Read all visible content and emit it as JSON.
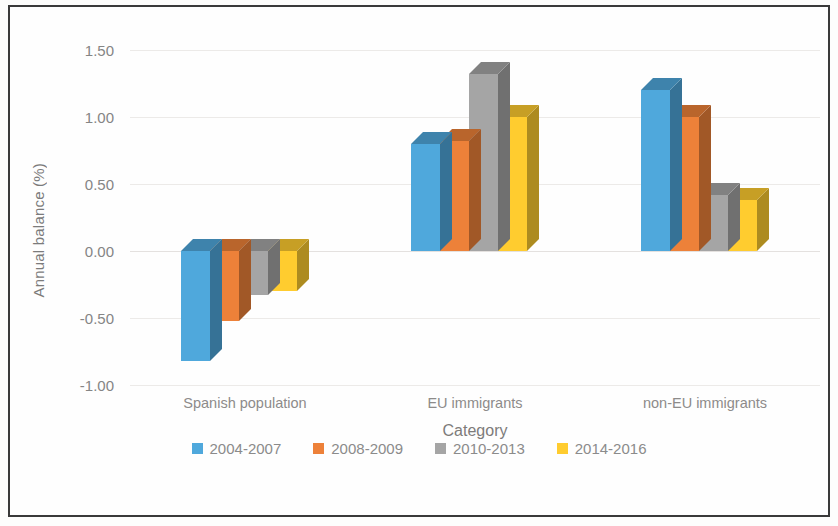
{
  "chart_data": {
    "type": "bar",
    "title": "",
    "subtitle": "",
    "xlabel": "Category",
    "ylabel": "Annual balance (%)",
    "categories": [
      "Spanish population",
      "EU immigrants",
      "non-EU immigrants"
    ],
    "series": [
      {
        "name": "2004-2007",
        "color": "#4FA8DC",
        "values": [
          -0.82,
          0.8,
          1.2
        ]
      },
      {
        "name": "2008-2009",
        "color": "#ED8139",
        "values": [
          -0.52,
          0.82,
          1.0
        ]
      },
      {
        "name": "2010-2013",
        "color": "#A5A5A5",
        "values": [
          -0.33,
          1.32,
          0.42
        ]
      },
      {
        "name": "2014-2016",
        "color": "#FFCC2F",
        "values": [
          -0.3,
          1.0,
          0.38
        ]
      }
    ],
    "ylim": [
      -1.0,
      1.5
    ],
    "yticks": [
      1.5,
      1.0,
      0.5,
      0.0,
      -0.5,
      -1.0
    ],
    "ytick_labels": [
      "1.50",
      "1.00",
      "0.50",
      "0.00",
      "-0.50",
      "-1.00"
    ],
    "grid": true,
    "grid_axis": "y",
    "legend_position": "bottom",
    "style": "3d-clustered-column",
    "border": "#3a3a3a"
  }
}
